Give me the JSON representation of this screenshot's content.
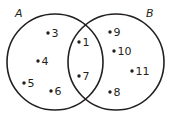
{
  "diagram": {
    "type": "venn",
    "sets": [
      {
        "id": "A",
        "label": "A",
        "only_elements": [
          "3",
          "4",
          "5",
          "6"
        ]
      },
      {
        "id": "B",
        "label": "B",
        "only_elements": [
          "9",
          "10",
          "11",
          "8"
        ]
      }
    ],
    "intersection": [
      "1",
      "7"
    ],
    "stroke_color": "#231f20"
  }
}
